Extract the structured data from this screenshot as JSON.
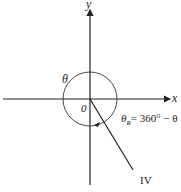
{
  "diagram": {
    "axes": {
      "x_label": "x",
      "y_label": "y",
      "origin_label": "0"
    },
    "angle_label": "θ",
    "reference_angle": {
      "symbol": "θ",
      "subscript": "R",
      "expression": "= 360° − θ"
    },
    "quadrant_label": "IV",
    "colors": {
      "line": "#222222",
      "background": "#ffffff"
    }
  }
}
